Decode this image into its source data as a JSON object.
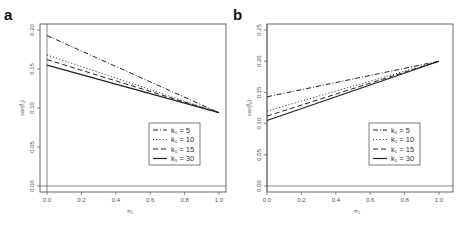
{
  "chart_data": [
    {
      "type": "line",
      "panel_label": "a",
      "xlabel": "π₁",
      "ylabel": "var(f̂₁)",
      "xlim": [
        0.0,
        1.0
      ],
      "ylim": [
        0.0,
        0.2
      ],
      "xticks": [
        "0.0",
        "0.2",
        "0.4",
        "0.6",
        "0.8",
        "1.0"
      ],
      "yticks": [
        "0.00",
        "0.05",
        "0.10",
        "0.15",
        "0.20"
      ],
      "grid": false,
      "legend_position": "bottom-right",
      "series": [
        {
          "name": "k₁ = 5",
          "style": "dotdash",
          "x": [
            0.0,
            1.0
          ],
          "y": [
            0.193,
            0.094
          ]
        },
        {
          "name": "k₁ = 10",
          "style": "dotted",
          "x": [
            0.0,
            1.0
          ],
          "y": [
            0.168,
            0.094
          ]
        },
        {
          "name": "k₁ = 15",
          "style": "dashed",
          "x": [
            0.0,
            1.0
          ],
          "y": [
            0.162,
            0.094
          ]
        },
        {
          "name": "k₁ = 30",
          "style": "solid",
          "x": [
            0.0,
            1.0
          ],
          "y": [
            0.155,
            0.094
          ]
        }
      ]
    },
    {
      "type": "line",
      "panel_label": "b",
      "xlabel": "π₂",
      "ylabel": "var(f̂₂)",
      "xlim": [
        0.0,
        1.0
      ],
      "ylim": [
        0.0,
        0.25
      ],
      "xticks": [
        "0.0",
        "0.2",
        "0.4",
        "0.6",
        "0.8",
        "1.0"
      ],
      "yticks": [
        "0.00",
        "0.05",
        "0.10",
        "0.15",
        "0.20",
        "0.25"
      ],
      "grid": false,
      "legend_position": "bottom-right",
      "series": [
        {
          "name": "k₁ = 5",
          "style": "dotdash",
          "x": [
            0.0,
            1.0
          ],
          "y": [
            0.143,
            0.2
          ]
        },
        {
          "name": "k₁ = 10",
          "style": "dotted",
          "x": [
            0.0,
            1.0
          ],
          "y": [
            0.12,
            0.2
          ]
        },
        {
          "name": "k₁ = 15",
          "style": "dashed",
          "x": [
            0.0,
            1.0
          ],
          "y": [
            0.112,
            0.2
          ]
        },
        {
          "name": "k₁ = 30",
          "style": "solid",
          "x": [
            0.0,
            1.0
          ],
          "y": [
            0.105,
            0.2
          ]
        }
      ]
    }
  ]
}
